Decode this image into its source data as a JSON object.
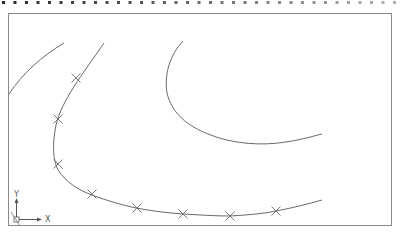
{
  "drawing": {
    "type": "cad-spline-drawing",
    "line_color": "#6a6a6a",
    "border_color": "#8a8a8a",
    "marker_color": "#6a6a6a",
    "curves": [
      {
        "name": "left-arc",
        "description": "short arc at upper-left"
      },
      {
        "name": "fit-spline",
        "description": "spline through fit points",
        "fit_point_count": 9
      },
      {
        "name": "right-hook",
        "description": "hook-shaped curve at upper-right"
      }
    ],
    "ucs_icon": {
      "x_label": "X",
      "y_label": "Y"
    }
  }
}
